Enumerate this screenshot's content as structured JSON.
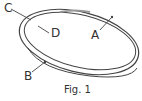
{
  "figure": {
    "caption": "Fig. 1",
    "labels": {
      "a": "A",
      "b": "B",
      "c": "C",
      "d": "D"
    }
  }
}
